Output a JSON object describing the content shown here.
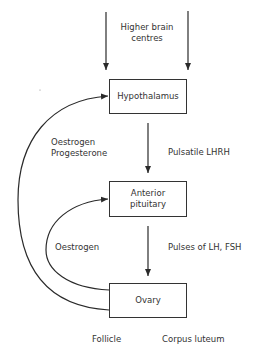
{
  "diagram": {
    "nodes": {
      "higher_brain": {
        "line1": "Higher brain",
        "line2": "centres"
      },
      "hypothalamus": {
        "label": "Hypothalamus"
      },
      "anterior_pituitary": {
        "line1": "Anterior",
        "line2": "pituitary"
      },
      "ovary": {
        "label": "Ovary"
      }
    },
    "edges": {
      "hypothalamus_to_pituitary": {
        "label": "Pulsatile LHRH"
      },
      "pituitary_to_ovary": {
        "label": "Pulses of LH, FSH"
      },
      "ovary_to_hypothalamus": {
        "line1": "Oestrogen",
        "line2": "Progesterone"
      },
      "ovary_to_pituitary": {
        "label": "Oestrogen"
      }
    },
    "ovary_parts": {
      "left": "Follicle",
      "right": "Corpus luteum"
    },
    "colors": {
      "line": "#2a2a2a",
      "text": "#333333",
      "background": "#ffffff"
    }
  }
}
